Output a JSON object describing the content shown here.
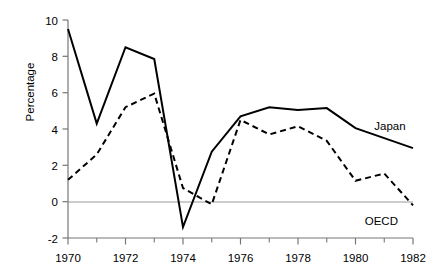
{
  "chart_data": {
    "type": "line",
    "title": "",
    "subtitle": "",
    "xlabel": "",
    "ylabel": "Percentage",
    "x": [
      1970,
      1971,
      1972,
      1973,
      1974,
      1975,
      1976,
      1977,
      1978,
      1979,
      1980,
      1981,
      1982
    ],
    "xlim": [
      1970,
      1982
    ],
    "ylim": [
      -2,
      10
    ],
    "xticks": [
      1970,
      1971,
      1972,
      1973,
      1974,
      1975,
      1976,
      1977,
      1978,
      1979,
      1980,
      1981,
      1982
    ],
    "xtick_labels": [
      "1970",
      "",
      "1972",
      "",
      "1974",
      "",
      "1976",
      "",
      "1978",
      "",
      "1980",
      "",
      "1982"
    ],
    "xtick_major_labels": [
      "1970",
      "1972",
      "1974",
      "1976",
      "1978",
      "1980",
      "1982"
    ],
    "yticks": [
      -2,
      0,
      2,
      4,
      6,
      8,
      10
    ],
    "ytick_labels": [
      "-2",
      "0",
      "2",
      "4",
      "6",
      "8",
      "10"
    ],
    "grid": false,
    "zero_line": true,
    "legend_position": "inline-right",
    "series": [
      {
        "name": "Japan",
        "style": "solid",
        "color": "#000000",
        "label_text": "Japan",
        "values": [
          9.5,
          4.3,
          8.5,
          7.85,
          -1.4,
          2.75,
          4.7,
          5.2,
          5.05,
          5.15,
          4.05,
          3.5,
          2.95
        ]
      },
      {
        "name": "OECD",
        "style": "dashed",
        "color": "#000000",
        "label_text": "OECD",
        "values": [
          1.2,
          2.6,
          5.2,
          5.95,
          0.75,
          -0.15,
          4.5,
          3.7,
          4.15,
          3.35,
          1.15,
          1.55,
          -0.2
        ]
      }
    ],
    "annotations": [
      {
        "text": "Japan",
        "x": 1981.2,
        "y": 4.15
      },
      {
        "text": "OECD",
        "x": 1980.9,
        "y": -1.05
      }
    ]
  },
  "axes": {
    "y_axis_title": "Percentage",
    "y_tick_0": "0",
    "y_tick_2": "2",
    "y_tick_4": "4",
    "y_tick_6": "6",
    "y_tick_8": "8",
    "y_tick_10": "10",
    "y_tick_neg2": "-2",
    "x_tick_1970": "1970",
    "x_tick_1972": "1972",
    "x_tick_1974": "1974",
    "x_tick_1976": "1976",
    "x_tick_1978": "1978",
    "x_tick_1980": "1980",
    "x_tick_1982": "1982"
  },
  "labels": {
    "japan": "Japan",
    "oecd": "OECD"
  },
  "colors": {
    "background": "#ffffff",
    "line": "#000000",
    "axis": "#777777",
    "zero_line": "#999999"
  }
}
